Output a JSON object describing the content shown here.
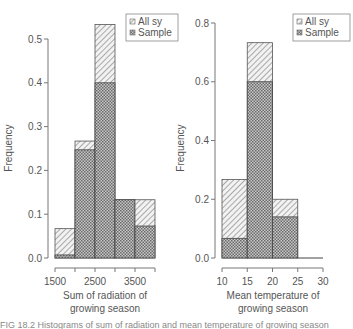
{
  "chart_data": [
    {
      "type": "bar",
      "subtype": "overlaid-histogram",
      "title": "",
      "xlabel": "Sum of radiation of growing season",
      "xlabel_lines": [
        "Sum of radiation of",
        "growing season"
      ],
      "ylabel": "Frequency",
      "bins": [
        [
          1500,
          2000
        ],
        [
          2000,
          2500
        ],
        [
          2500,
          3000
        ],
        [
          3000,
          3500
        ],
        [
          3500,
          4000
        ]
      ],
      "xticks": [
        1500,
        2000,
        2500,
        3000,
        3500,
        4000
      ],
      "xtick_labels": [
        "1500",
        "",
        "2500",
        "",
        "3500",
        ""
      ],
      "yticks": [
        0.0,
        0.1,
        0.2,
        0.3,
        0.4,
        0.5
      ],
      "ytick_labels": [
        "0.0",
        "0.1",
        "0.2",
        "0.3",
        "0.4",
        "0.5"
      ],
      "xlim": [
        1500,
        4000
      ],
      "ylim": [
        0,
        0.5
      ],
      "series": [
        {
          "name": "All sy",
          "pattern": "diagonal-hatch",
          "values": [
            0.067,
            0.267,
            0.533,
            0.133,
            0.133
          ]
        },
        {
          "name": "Sample",
          "pattern": "crosshatch",
          "values": [
            0.007,
            0.247,
            0.4,
            0.133,
            0.073
          ]
        }
      ],
      "legend": {
        "position": "top-right",
        "entries": [
          "All sy",
          "Sample"
        ]
      },
      "grid": false
    },
    {
      "type": "bar",
      "subtype": "overlaid-histogram",
      "title": "",
      "xlabel": "Mean temperature of growing season",
      "xlabel_lines": [
        "Mean temperature of",
        "growing season"
      ],
      "ylabel": "Frequency",
      "bins": [
        [
          10,
          15
        ],
        [
          15,
          20
        ],
        [
          20,
          25
        ],
        [
          25,
          30
        ]
      ],
      "xticks": [
        10,
        15,
        20,
        25,
        30
      ],
      "xtick_labels": [
        "10",
        "15",
        "20",
        "25",
        "30"
      ],
      "yticks": [
        0.0,
        0.2,
        0.4,
        0.6,
        0.8
      ],
      "ytick_labels": [
        "0.0",
        "0.2",
        "0.4",
        "0.6",
        "0.8"
      ],
      "xlim": [
        10,
        30
      ],
      "ylim": [
        0,
        0.8
      ],
      "series": [
        {
          "name": "All sy",
          "pattern": "diagonal-hatch",
          "values": [
            0.267,
            0.733,
            0.2,
            0.0
          ]
        },
        {
          "name": "Sample",
          "pattern": "crosshatch",
          "values": [
            0.067,
            0.6,
            0.14,
            0.0
          ]
        }
      ],
      "legend": {
        "position": "top-right",
        "entries": [
          "All sy",
          "Sample"
        ]
      },
      "grid": false
    }
  ],
  "caption_fragment": "FIG 18.2   Histograms of sum of radiation and mean temperature of growing season"
}
